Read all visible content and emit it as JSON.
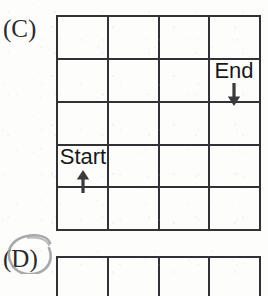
{
  "figure": {
    "type": "grid-puzzle-worksheet",
    "background_color": "#fdfdfc",
    "ink_color": "#323236"
  },
  "panels": [
    {
      "label": "(C)",
      "name": "panel-c",
      "grid": {
        "columns": 4,
        "rows": 5,
        "markers": [
          {
            "name": "end",
            "text": "End",
            "arrow": "arrow-down-icon",
            "arrow_glyph": "↓",
            "column": 4,
            "row": 2
          },
          {
            "name": "start",
            "text": "Start",
            "arrow": "arrow-up-icon",
            "arrow_glyph": "↑",
            "column": 1,
            "row": 4
          }
        ]
      }
    },
    {
      "label": "(D)",
      "name": "panel-d",
      "annotation": "hand-drawn-circle",
      "grid": {
        "columns": 4,
        "rows": 1,
        "markers": []
      }
    }
  ]
}
